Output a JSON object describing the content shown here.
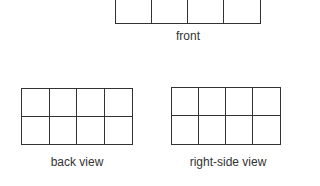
{
  "views": [
    {
      "id": "front",
      "label": "front",
      "rows": 1,
      "cols": 4
    },
    {
      "id": "back",
      "label": "back view",
      "rows": 2,
      "cols": 4
    },
    {
      "id": "right",
      "label": "right-side view",
      "rows": 2,
      "cols": 4
    }
  ],
  "colors": {
    "line": "#333333",
    "background": "#ffffff",
    "text": "#333333"
  }
}
